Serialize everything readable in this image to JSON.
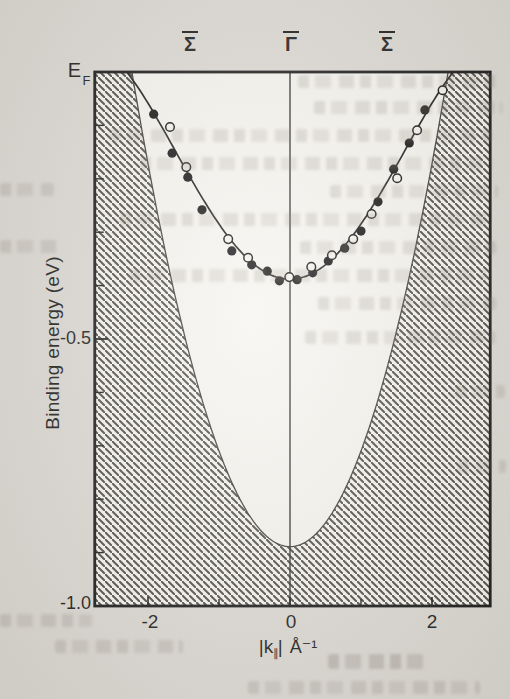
{
  "figure_kind": "scanned journal figure: surface-state band dispersion with projected bulk band continuum (hatched)",
  "colors": {
    "paper": "#dcd9d3",
    "plot_background": "#f6f4ef",
    "ink": "#1b1b1b",
    "hatch_line": "#4e4b46"
  },
  "chart_data": {
    "type": "scatter",
    "title": "",
    "ylabel": "Binding energy (eV)",
    "xlabel_parts": {
      "open_bar": "|",
      "symbol": "k",
      "subscript": "∥",
      "close_bar": "|",
      "unit": "Å⁻¹"
    },
    "fermi_label": {
      "main": "E",
      "sub": "F"
    },
    "xlim": [
      -2.75,
      2.82
    ],
    "ylim": [
      -1.0,
      0.0
    ],
    "x_tick_labels": [
      "-2",
      "0",
      "2"
    ],
    "x_ticks_major": [
      -2,
      0,
      2
    ],
    "x_ticks_minor": [
      -1,
      1
    ],
    "y_ticks_labeled": [
      {
        "value": -0.5,
        "label": "-0.5"
      },
      {
        "value": -1.0,
        "label": "-1.0"
      }
    ],
    "y_ticks_minor_step": 0.1,
    "top_labels": [
      {
        "text": "Σ",
        "overline": true,
        "k": -1.41
      },
      {
        "text": "Γ",
        "overline": true,
        "k": 0.0
      },
      {
        "text": "Σ",
        "overline": true,
        "k": 1.37
      }
    ],
    "grid": false,
    "legend": "none",
    "series": [
      {
        "name": "surface-state-filled-circles",
        "marker": "filled-circle",
        "points": [
          [
            -1.92,
            -0.079
          ],
          [
            -1.66,
            -0.152
          ],
          [
            -1.44,
            -0.197
          ],
          [
            -1.24,
            -0.258
          ],
          [
            -0.82,
            -0.335
          ],
          [
            -0.54,
            -0.361
          ],
          [
            -0.32,
            -0.373
          ],
          [
            -0.15,
            -0.391
          ],
          [
            0.1,
            -0.389
          ],
          [
            0.32,
            -0.376
          ],
          [
            0.54,
            -0.354
          ],
          [
            0.77,
            -0.33
          ],
          [
            1.0,
            -0.298
          ],
          [
            1.24,
            -0.243
          ],
          [
            1.46,
            -0.182
          ],
          [
            1.68,
            -0.133
          ],
          [
            1.9,
            -0.071
          ]
        ]
      },
      {
        "name": "surface-state-open-circles",
        "marker": "open-circle",
        "points": [
          [
            -1.69,
            -0.103
          ],
          [
            -1.46,
            -0.178
          ],
          [
            -0.87,
            -0.313
          ],
          [
            -0.59,
            -0.348
          ],
          [
            -0.01,
            -0.384
          ],
          [
            0.3,
            -0.365
          ],
          [
            0.59,
            -0.343
          ],
          [
            0.89,
            -0.313
          ],
          [
            1.15,
            -0.266
          ],
          [
            1.51,
            -0.199
          ],
          [
            1.79,
            -0.109
          ],
          [
            2.15,
            -0.034
          ]
        ]
      }
    ],
    "fit_curve": {
      "type": "polynomial",
      "E0": -0.388,
      "k2_coeff": 0.1103,
      "k4_coeff": -0.00698,
      "k_range": [
        -2.302,
        2.302
      ]
    },
    "bulk_band_edge": {
      "type": "parabola",
      "E0": -0.889,
      "k2_coeff": 0.1793,
      "k_range": [
        -2.227,
        2.227
      ],
      "fill": "hatched"
    }
  }
}
